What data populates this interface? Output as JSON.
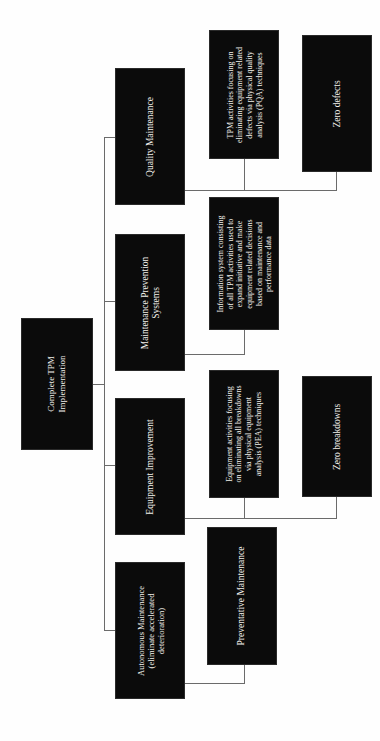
{
  "diagram": {
    "title": "Complete TPM Implementation",
    "orientation": "rotated-90",
    "root": {
      "id": "complete-tpm-implementation",
      "label": "Complete TPM\nImplementation"
    },
    "pillars": [
      {
        "id": "quality-maintenance",
        "label": "Quality Maintenance",
        "detail": {
          "id": "quality-maintenance-detail",
          "label": "TPM activities focusing on\neliminating equipment related\ndefects via physical quality\nanalysis (PQA) techniques"
        },
        "outcome": {
          "id": "zero-defects",
          "label": "Zero defects"
        }
      },
      {
        "id": "maintenance-prevention-systems",
        "label": "Maintenance Prevention\nSystems",
        "detail": {
          "id": "maintenance-prevention-systems-detail",
          "label": "Information system consisting\nof all TPM activities used to\nexpand initiative and make\nequipment related decisions\nbased on maintenance and\nperformance data"
        },
        "outcome": null
      },
      {
        "id": "equipment-improvement",
        "label": "Equipment Improvement",
        "detail": {
          "id": "equipment-improvement-detail",
          "label": "Equipment activities focusing\non eliminating all breakdowns\nvia physical equipment\nanalysis (PEA) techniques"
        },
        "outcome": {
          "id": "zero-breakdowns",
          "label": "Zero breakdowns"
        }
      },
      {
        "id": "autonomous-maintenance",
        "label": "Autonomous Maintenance\n(eliminate accelerated\ndeterioration)",
        "detail": {
          "id": "preventative-maintenance",
          "label": "Preventative Maintenance"
        },
        "outcome": null
      }
    ],
    "colors": {
      "box_fill": "#0b0b0b",
      "box_border": "#2a2a2a",
      "text": "#f3f1ec",
      "connector": "#6b6b6b",
      "background": "#fefefe"
    }
  }
}
